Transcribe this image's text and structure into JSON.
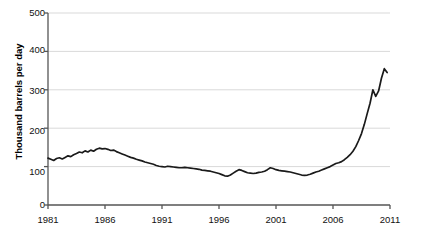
{
  "chart_data": {
    "type": "line",
    "title": "",
    "xlabel": "",
    "ylabel": "Thousand barrels per day",
    "xlim": [
      1981,
      2011
    ],
    "ylim": [
      0,
      500
    ],
    "ytick_labels": [
      "500",
      "400",
      "300",
      "200",
      "100",
      "0"
    ],
    "ytick_values": [
      500,
      400,
      300,
      200,
      100,
      0
    ],
    "xtick_labels": [
      "1981",
      "1986",
      "1991",
      "1996",
      "2001",
      "2006",
      "2011"
    ],
    "xtick_values": [
      1981,
      1986,
      1991,
      1996,
      2001,
      2006,
      2011
    ],
    "grid": "horizontal",
    "legend": "none",
    "line_color": "#1a1a1a",
    "grid_color": "#d9d9d9",
    "axis_color": "#555555",
    "background_color": "#ffffff",
    "series": [
      {
        "name": "Production",
        "x": [
          1981.0,
          1981.25,
          1981.5,
          1981.75,
          1982.0,
          1982.25,
          1982.5,
          1982.75,
          1983.0,
          1983.25,
          1983.5,
          1983.75,
          1984.0,
          1984.25,
          1984.5,
          1984.75,
          1985.0,
          1985.25,
          1985.5,
          1985.75,
          1986.0,
          1986.25,
          1986.5,
          1986.75,
          1987.0,
          1987.25,
          1987.5,
          1987.75,
          1988.0,
          1988.25,
          1988.5,
          1988.75,
          1989.0,
          1989.25,
          1989.5,
          1989.75,
          1990.0,
          1990.25,
          1990.5,
          1990.75,
          1991.0,
          1991.25,
          1991.5,
          1991.75,
          1992.0,
          1992.25,
          1992.5,
          1992.75,
          1993.0,
          1993.25,
          1993.5,
          1993.75,
          1994.0,
          1994.25,
          1994.5,
          1994.75,
          1995.0,
          1995.25,
          1995.5,
          1995.75,
          1996.0,
          1996.25,
          1996.5,
          1996.75,
          1997.0,
          1997.25,
          1997.5,
          1997.75,
          1998.0,
          1998.25,
          1998.5,
          1998.75,
          1999.0,
          1999.25,
          1999.5,
          1999.75,
          2000.0,
          2000.25,
          2000.5,
          2000.75,
          2001.0,
          2001.25,
          2001.5,
          2001.75,
          2002.0,
          2002.25,
          2002.5,
          2002.75,
          2003.0,
          2003.25,
          2003.5,
          2003.75,
          2004.0,
          2004.25,
          2004.5,
          2004.75,
          2005.0,
          2005.25,
          2005.5,
          2005.75,
          2006.0,
          2006.25,
          2006.5,
          2006.75,
          2007.0,
          2007.25,
          2007.5,
          2007.75,
          2008.0,
          2008.25,
          2008.5,
          2008.75,
          2009.0,
          2009.25,
          2009.5,
          2009.75,
          2010.0,
          2010.25,
          2010.5,
          2010.75
        ],
        "values": [
          122,
          119,
          116,
          121,
          123,
          120,
          124,
          128,
          126,
          131,
          134,
          138,
          136,
          141,
          138,
          143,
          140,
          145,
          148,
          146,
          147,
          145,
          142,
          143,
          139,
          136,
          133,
          130,
          127,
          124,
          122,
          119,
          117,
          115,
          112,
          110,
          108,
          106,
          103,
          101,
          100,
          99,
          101,
          100,
          99,
          98,
          97,
          97,
          98,
          97,
          96,
          95,
          94,
          93,
          91,
          90,
          89,
          88,
          86,
          84,
          82,
          79,
          76,
          75,
          78,
          83,
          88,
          92,
          90,
          87,
          84,
          83,
          82,
          83,
          85,
          86,
          88,
          92,
          97,
          95,
          92,
          90,
          89,
          88,
          87,
          86,
          84,
          82,
          80,
          78,
          77,
          78,
          80,
          83,
          86,
          88,
          91,
          94,
          97,
          100,
          104,
          108,
          110,
          113,
          118,
          124,
          131,
          140,
          152,
          168,
          186,
          210,
          238,
          265,
          300,
          283,
          297,
          330,
          355,
          345
        ]
      }
    ],
    "annotations": []
  }
}
